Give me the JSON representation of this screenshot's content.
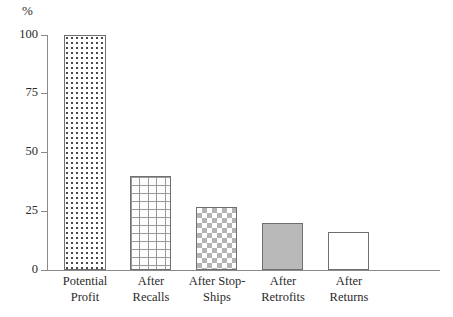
{
  "chart_data": {
    "type": "bar",
    "title": "",
    "subtitle": "",
    "xlabel": "",
    "ylabel": "%",
    "unit_label": "%",
    "categories": [
      "Potential\nProfit",
      "After\nRecalls",
      "After Stop-\nShips",
      "After\nRetrofits",
      "After\nReturns"
    ],
    "values": [
      100,
      40,
      27,
      20,
      16
    ],
    "ylim": [
      0,
      100
    ],
    "yticks": [
      100,
      75,
      50,
      25,
      0
    ],
    "ytick_labels": [
      "100",
      "75",
      "50",
      "25",
      "0"
    ],
    "grid": false,
    "legend": "none",
    "bar_fills": [
      "dotted",
      "brick",
      "checkerboard",
      "solid-gray",
      "empty-white"
    ],
    "colors": {
      "axis": "#8a8a8a",
      "bar_border": "#6f6f6f",
      "solid_bar": "#b9b9b9",
      "checker": "#b4b4b4",
      "brick_line": "#9a9a9a",
      "dot": "#4a4a4a",
      "background": "#ffffff",
      "text": "#2b2b2b"
    }
  }
}
